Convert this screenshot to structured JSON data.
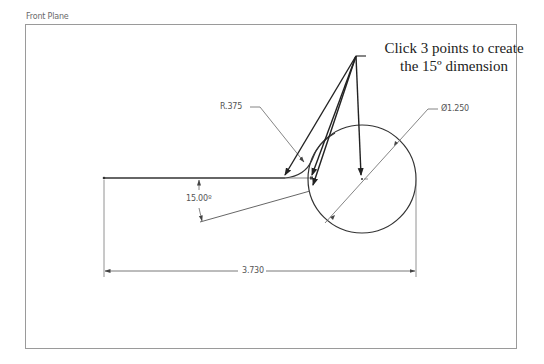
{
  "view": {
    "plane_label": "Front Plane"
  },
  "callout": {
    "line1": "Click 3 points to create",
    "line2": "the 15º dimension"
  },
  "dimensions": {
    "radius": "R.375",
    "diameter": "Ø1.250",
    "angle": "15.00º",
    "length": "3.730"
  },
  "colors": {
    "geometry": "#333333",
    "dimension_lines": "#777777",
    "frame": "#9a9a9a",
    "background": "#ffffff"
  }
}
